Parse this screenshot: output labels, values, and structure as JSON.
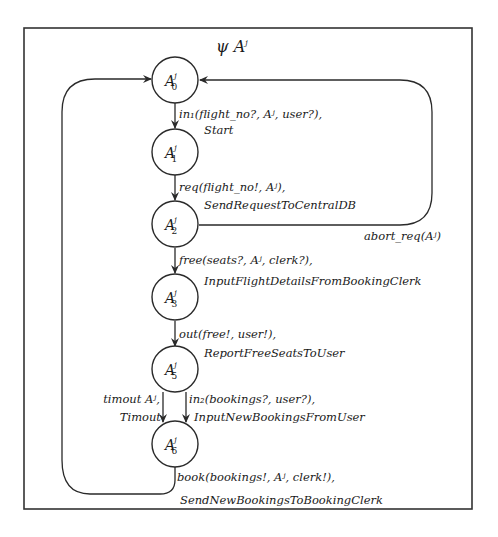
{
  "diagram": {
    "title": {
      "base": "ψ A",
      "sup": "j"
    },
    "nodes": [
      {
        "id": "A0",
        "base": "A",
        "sup": "j",
        "sub": "0"
      },
      {
        "id": "A1",
        "base": "A",
        "sup": "j",
        "sub": "1"
      },
      {
        "id": "A2",
        "base": "A",
        "sup": "j",
        "sub": "2"
      },
      {
        "id": "A3",
        "base": "A",
        "sup": "j",
        "sub": "3"
      },
      {
        "id": "A5",
        "base": "A",
        "sup": "j",
        "sub": "5"
      },
      {
        "id": "A6",
        "base": "A",
        "sup": "j",
        "sub": "6"
      }
    ],
    "edges": [
      {
        "from": "A0",
        "to": "A1",
        "event": "in₁(flight_no?, Aʲ, user?),",
        "action": "Start"
      },
      {
        "from": "A1",
        "to": "A2",
        "event": "req(flight_no!, Aʲ),",
        "action": "SendRequestToCentralDB"
      },
      {
        "from": "A2",
        "to": "A0",
        "event": "abort_req(Aʲ)",
        "action": ""
      },
      {
        "from": "A2",
        "to": "A3",
        "event": "free(seats?, Aʲ, clerk?),",
        "action": "InputFlightDetailsFromBookingClerk"
      },
      {
        "from": "A3",
        "to": "A5",
        "event": "out(free!, user!),",
        "action": "ReportFreeSeatsToUser"
      },
      {
        "from": "A5",
        "to": "A6",
        "event": "timout Aʲ,",
        "action": "Timout"
      },
      {
        "from": "A5",
        "to": "A6",
        "event": "in₂(bookings?, user?),",
        "action": "InputNewBookingsFromUser"
      },
      {
        "from": "A6",
        "to": "A0",
        "event": "book(bookings!, Aʲ, clerk!),",
        "action": "SendNewBookingsToBookingClerk"
      }
    ]
  }
}
